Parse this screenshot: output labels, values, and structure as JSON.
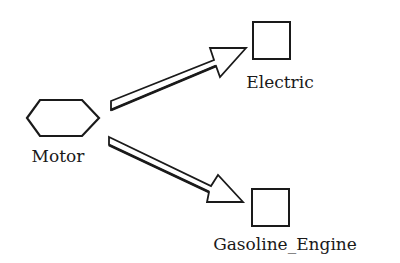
{
  "diagram": {
    "type": "generalization",
    "nodes": [
      {
        "id": "motor",
        "label": "Motor",
        "shape": "hexagon"
      },
      {
        "id": "electric",
        "label": "Electric",
        "shape": "square"
      },
      {
        "id": "gasoline_engine",
        "label": "Gasoline_Engine",
        "shape": "square"
      }
    ],
    "edges": [
      {
        "from": "motor",
        "to": "electric",
        "style": "hollow-double-arrow"
      },
      {
        "from": "motor",
        "to": "gasoline_engine",
        "style": "hollow-double-arrow"
      }
    ],
    "colors": {
      "stroke": "#1a1a1a",
      "background": "#ffffff"
    }
  }
}
